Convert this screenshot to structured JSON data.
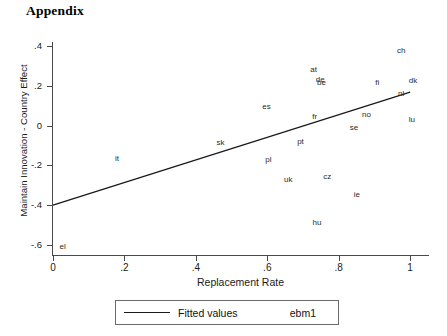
{
  "page": {
    "title": "Appendix"
  },
  "chart_data": {
    "type": "scatter",
    "title": "",
    "xlabel": "Replacement Rate",
    "ylabel": "Maintain Innovation - Country Effect",
    "xlim": [
      0,
      1.05
    ],
    "ylim": [
      -0.65,
      0.42
    ],
    "xticks": [
      0,
      0.2,
      0.4,
      0.6,
      0.8,
      1
    ],
    "xticklabels": [
      "0",
      ".2",
      ".4",
      ".6",
      ".8",
      "1"
    ],
    "yticks": [
      0.4,
      0.2,
      0,
      -0.2,
      -0.4,
      -0.6
    ],
    "yticklabels": [
      ".4",
      ".2",
      "0",
      "-.2",
      "-.4",
      "-.6"
    ],
    "grid": false,
    "marker_style": "text-label",
    "points": [
      {
        "label": "ch",
        "x": 0.975,
        "y": 0.375
      },
      {
        "label": "at",
        "x": 0.73,
        "y": 0.278
      },
      {
        "label": "de",
        "x": 0.748,
        "y": 0.228
      },
      {
        "label": "be",
        "x": 0.752,
        "y": 0.214
      },
      {
        "label": "fi",
        "x": 0.908,
        "y": 0.215
      },
      {
        "label": "dk",
        "x": 1.008,
        "y": 0.222
      },
      {
        "label": "nl",
        "x": 0.975,
        "y": 0.16
      },
      {
        "label": "es",
        "x": 0.598,
        "y": 0.092
      },
      {
        "label": "fr",
        "x": 0.733,
        "y": 0.043
      },
      {
        "label": "no",
        "x": 0.878,
        "y": 0.052
      },
      {
        "label": "lu",
        "x": 1.005,
        "y": 0.026
      },
      {
        "label": "se",
        "x": 0.843,
        "y": -0.011
      },
      {
        "label": "pt",
        "x": 0.693,
        "y": -0.08
      },
      {
        "label": "sk",
        "x": 0.469,
        "y": -0.086
      },
      {
        "label": "it",
        "x": 0.179,
        "y": -0.167
      },
      {
        "label": "pl",
        "x": 0.603,
        "y": -0.172
      },
      {
        "label": "cz",
        "x": 0.768,
        "y": -0.258
      },
      {
        "label": "uk",
        "x": 0.659,
        "y": -0.272
      },
      {
        "label": "ie",
        "x": 0.851,
        "y": -0.351
      },
      {
        "label": "hu",
        "x": 0.739,
        "y": -0.488
      },
      {
        "label": "el",
        "x": 0.027,
        "y": -0.608
      }
    ],
    "fit_line": {
      "name": "Fitted values",
      "x_start": 0.0,
      "y_start": -0.4,
      "x_end": 1.0,
      "y_end": 0.168
    },
    "legend": {
      "position": "below-axes",
      "fitted_label": "Fitted values",
      "series_label": "ebm1"
    }
  }
}
